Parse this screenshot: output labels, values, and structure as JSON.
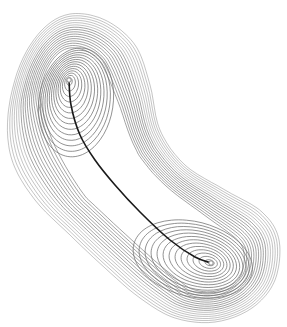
{
  "diagram": {
    "type": "contour-plot",
    "minima": [
      {
        "name": "upper-left minimum",
        "x": 69,
        "y": 80
      },
      {
        "name": "lower-right minimum",
        "x": 211,
        "y": 263
      }
    ],
    "saddle": {
      "x": 120,
      "y": 180
    },
    "path_points": [
      [
        69,
        80
      ],
      [
        71,
        105
      ],
      [
        80,
        135
      ],
      [
        95,
        160
      ],
      [
        115,
        185
      ],
      [
        140,
        212
      ],
      [
        170,
        240
      ],
      [
        195,
        257
      ],
      [
        211,
        263
      ]
    ],
    "contour_count": 34,
    "colors": {
      "background": "#ffffff",
      "contour": "#6e6e6e",
      "path": "#1a1a1a",
      "minimum_marker": "#888888"
    }
  }
}
